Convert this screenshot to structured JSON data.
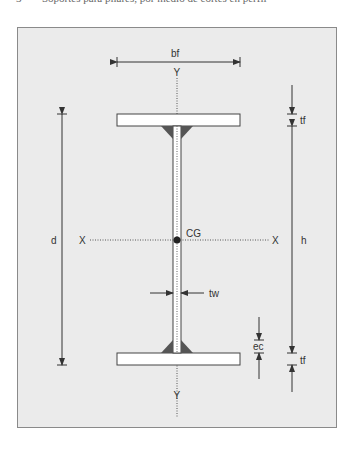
{
  "caption": {
    "number": "3",
    "text": "Soportes para pilares, por medio de cortes en perfil"
  },
  "diagram": {
    "labels": {
      "flange_width": "bf",
      "y_axis_top": "Y",
      "y_axis_bottom": "Y",
      "x_axis_left": "X",
      "x_axis_right": "X",
      "centroid": "CG",
      "total_depth": "d",
      "web_height": "h",
      "flange_thickness_top": "tf",
      "flange_thickness_bottom": "tf",
      "web_thickness": "tw",
      "weld_size": "ec"
    },
    "colors": {
      "background": "#ebebeb",
      "frame": "#8a8a8a",
      "line": "#333333",
      "weld": "#555555",
      "section_fill": "#ffffff"
    }
  }
}
